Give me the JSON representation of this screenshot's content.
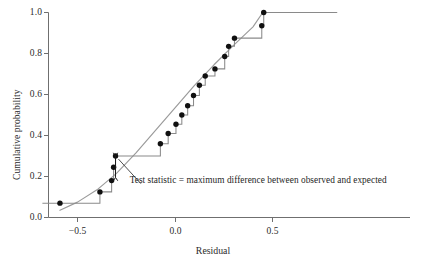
{
  "chart_data": {
    "type": "line",
    "title": "",
    "xlabel": "Residual",
    "ylabel": "Cumulative probability",
    "xlim": [
      -0.68,
      0.83
    ],
    "ylim": [
      0.0,
      1.0
    ],
    "xticks": [
      -0.5,
      0.0,
      0.5
    ],
    "xticklabels": [
      "−0.5",
      "0.0",
      "0.5"
    ],
    "yticks": [
      0.0,
      0.2,
      0.4,
      0.6,
      0.8,
      1.0
    ],
    "yticklabels": [
      "0.0",
      "0.2",
      "0.4",
      "0.6",
      "0.8",
      "1.0"
    ],
    "grid": false,
    "legend": null,
    "series": [
      {
        "name": "Observed cumulative proportion (empirical CDF, step)",
        "type": "step",
        "style": "post",
        "color": "#8a8a8a",
        "x": [
          -0.59,
          -0.385,
          -0.325,
          -0.315,
          -0.305,
          -0.075,
          -0.035,
          0.005,
          0.035,
          0.065,
          0.095,
          0.125,
          0.155,
          0.205,
          0.255,
          0.275,
          0.305,
          0.445,
          0.455
        ],
        "y": [
          0.07,
          0.125,
          0.18,
          0.245,
          0.3,
          0.36,
          0.41,
          0.455,
          0.5,
          0.545,
          0.595,
          0.645,
          0.69,
          0.725,
          0.785,
          0.835,
          0.875,
          0.935,
          1.0
        ]
      },
      {
        "name": "Expected cumulative probability (normal CDF, smooth)",
        "type": "line",
        "color": "#9a9a9a",
        "x": [
          -0.59,
          -0.5,
          -0.4,
          -0.3,
          -0.2,
          -0.1,
          0.0,
          0.1,
          0.2,
          0.3,
          0.4,
          0.45,
          0.83
        ],
        "y": [
          0.035,
          0.075,
          0.135,
          0.215,
          0.315,
          0.425,
          0.535,
          0.645,
          0.745,
          0.84,
          0.93,
          1.0,
          1.0
        ]
      }
    ],
    "points": {
      "name": "Observed data points",
      "marker": "filled-circle",
      "color": "#101010",
      "x": [
        -0.59,
        -0.385,
        -0.325,
        -0.315,
        -0.305,
        -0.075,
        -0.035,
        0.005,
        0.035,
        0.065,
        0.095,
        0.125,
        0.155,
        0.205,
        0.255,
        0.275,
        0.305,
        0.445,
        0.455
      ],
      "y": [
        0.07,
        0.125,
        0.18,
        0.245,
        0.3,
        0.36,
        0.41,
        0.455,
        0.5,
        0.545,
        0.595,
        0.645,
        0.69,
        0.725,
        0.785,
        0.835,
        0.875,
        0.935,
        1.0
      ]
    },
    "annotations": [
      {
        "name": "test-statistic-annotation",
        "text": "Test statistic = maximum difference between observed and expected",
        "text_x": 0.07,
        "text_y": 0.175,
        "arrow": {
          "type": "double-headed-vertical",
          "x": -0.305,
          "y_from": 0.3,
          "y_to": 0.195
        },
        "leader": {
          "from_x": -0.29,
          "from_y": 0.285,
          "to_x": -0.175,
          "to_y": 0.165
        }
      }
    ]
  },
  "axes": {
    "x_title": "Residual",
    "y_title": "Cumulative probability",
    "x_tick_labels": [
      "−0.5",
      "0.0",
      "0.5"
    ],
    "y_tick_labels": [
      "1.0",
      "0.8",
      "0.6",
      "0.4",
      "0.2",
      "0.0"
    ]
  },
  "annotation": {
    "text": "Test statistic = maximum difference between observed and expected"
  },
  "colors": {
    "axis": "#6f6f6f",
    "step_line": "#8a8a8a",
    "curve": "#9a9a9a",
    "marker": "#101010",
    "text": "#2b2b2b",
    "background": "#ffffff"
  }
}
